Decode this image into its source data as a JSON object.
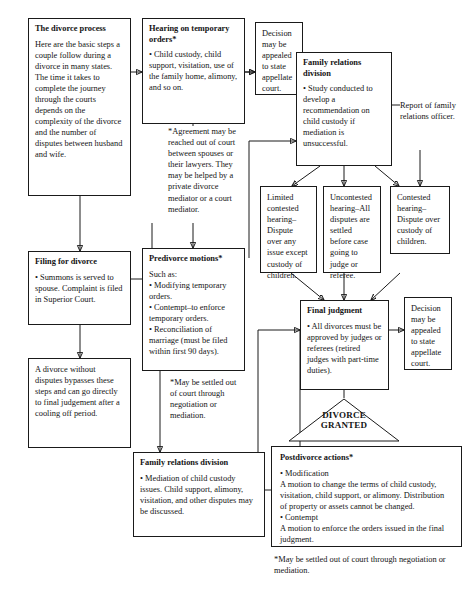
{
  "diagram": {
    "nodes": {
      "divorce_process": {
        "title": "The divorce process",
        "body": "Here are the basic steps  a couple follow during a divorce in many states. The time it takes to complete the journey through the courts depends on the  complexity of the divorce  and the number of disputes between husband and wife."
      },
      "filing": {
        "title": "Filing for divorce",
        "body": "• Summons is served to spouse. Complaint is filed in Superior Court."
      },
      "bypass": {
        "title": "",
        "body": "A divorce without disputes bypasses these steps and can go directly to final judgement after a cooling off period."
      },
      "hearing_temp": {
        "title": "Hearing on temporary orders*",
        "body": "• Child custody, child support, visitation, use of the family home, alimony, and so on."
      },
      "predivorce": {
        "title": "Predivorce motions*",
        "body": "Such as:\n• Modifying temporary orders.\n• Contempt–to enforce temporary orders.\n• Reconciliation of marriage (must be filed within first 90 days)."
      },
      "family_relations_mediation": {
        "title": "Family relations division",
        "body": "• Mediation of child custody issues. Child support, alimony, visitation, and other disputes may be discussed."
      },
      "decision_appeal_top": {
        "title": "",
        "body": "Decision may be appealed to state appellate court."
      },
      "family_relations_study": {
        "title": "Family relations division",
        "body": "• Study conducted to develop a recommendation on child custody if mediation is unsuccessful."
      },
      "report": {
        "title": "",
        "body": "Report of family relations officer."
      },
      "limited_contested": {
        "title": "",
        "body": "Limited contested hearing–Dispute over any issue except custody of children."
      },
      "uncontested": {
        "title": "",
        "body": "Uncontested hearing–All disputes are settled before case going to judge or referee."
      },
      "contested": {
        "title": "",
        "body": "Contested hearing–Dispute over custody of children."
      },
      "final_judgment": {
        "title": "Final judgment",
        "body": "• All divorces must be approved by judges or referees (retired judges with part-time duties)."
      },
      "decision_appeal_bottom": {
        "title": "",
        "body": "Decision may be appealed to state appellate court."
      },
      "divorce_granted": {
        "label": "DIVORCE\nGRANTED"
      },
      "postdivorce": {
        "title": "Postdivorce actions*",
        "body": "• Modification\nA motion to change the terms of child custody, visitation, child support, or alimony.  Distribution of property or assets cannot be changed.\n• Contempt\nA motion to enforce the orders issued in the final judgment."
      }
    },
    "notes": {
      "agreement": "*Agreement may be reached out of court between spouses or their lawyers.  They may be helped by a private divorce mediator or a court mediator.",
      "may_be_settled_left": "*May be settled out of court through negotiation or mediation.",
      "may_be_settled_bottom": "*May be settled out of court through negotiation or mediation."
    },
    "colors": {
      "stroke": "#1a1a1a",
      "background": "#ffffff",
      "text": "#141414"
    }
  }
}
